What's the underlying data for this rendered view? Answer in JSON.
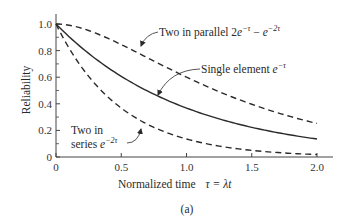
{
  "chart_data": {
    "type": "line",
    "title": "",
    "caption": "(a)",
    "xlabel": "Normalized time",
    "xlabel_math": "τ = λt",
    "ylabel": "Reliability",
    "xlim": [
      0,
      2.0
    ],
    "ylim": [
      0,
      1.0
    ],
    "xticks": [
      0,
      0.5,
      1.0,
      1.5,
      2.0
    ],
    "xtick_labels": [
      "0",
      "0.5",
      "1.0",
      "1.5",
      "2.0"
    ],
    "yticks": [
      0,
      0.2,
      0.4,
      0.6,
      0.8,
      1.0
    ],
    "ytick_labels": [
      "0",
      "0.2",
      "0.4",
      "0.6",
      "0.8",
      "1.0"
    ],
    "grid": false,
    "legend": "none (inline annotations)",
    "x": [
      0,
      0.25,
      0.5,
      0.75,
      1.0,
      1.25,
      1.5,
      1.75,
      2.0
    ],
    "series": [
      {
        "name": "Two in parallel",
        "formula": "2e^{-τ} − e^{-2τ}",
        "style": "dashed",
        "values": [
          1.0,
          0.951,
          0.845,
          0.721,
          0.6,
          0.491,
          0.397,
          0.318,
          0.252
        ]
      },
      {
        "name": "Single element",
        "formula": "e^{-τ}",
        "style": "solid",
        "values": [
          1.0,
          0.779,
          0.607,
          0.472,
          0.368,
          0.287,
          0.223,
          0.174,
          0.135
        ]
      },
      {
        "name": "Two in series",
        "formula": "e^{-2τ}",
        "style": "dashed",
        "values": [
          1.0,
          0.607,
          0.368,
          0.223,
          0.135,
          0.082,
          0.05,
          0.03,
          0.018
        ]
      }
    ],
    "annotations": [
      {
        "text": "Two in parallel",
        "math": "2e^{-τ} − e^{-2τ}",
        "target": "Two in parallel"
      },
      {
        "text": "Single element",
        "math": "e^{-τ}",
        "target": "Single element"
      },
      {
        "text": "Two in series",
        "math": "e^{-2τ}",
        "target": "Two in series"
      }
    ]
  },
  "labels": {
    "parallel_text": "Two in parallel 2",
    "single_text": "Single element ",
    "series_line1": "Two in",
    "series_line2": "series ",
    "e": "e",
    "exp_neg_tau": "−τ",
    "exp_neg_2tau": "−2τ",
    "minus": " − ",
    "xlabel": "Normalized time",
    "xlabel_math": "τ = λt",
    "ylabel": "Reliability",
    "caption": "(a)"
  },
  "colors": {
    "line": "#2a2a2a",
    "axis": "#444444",
    "text": "#2a2a2a",
    "background": "#ffffff"
  }
}
